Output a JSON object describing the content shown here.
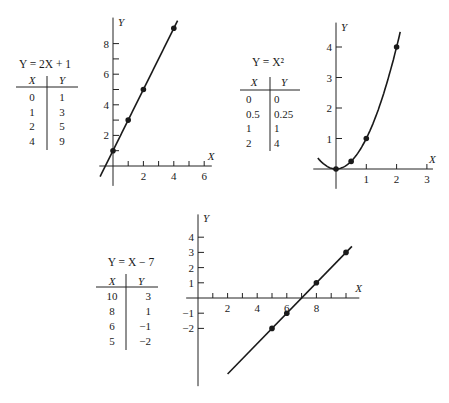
{
  "chart_data": [
    {
      "type": "line",
      "title": "Y = 2X + 1",
      "equation": "Y = 2X + 1",
      "xlabel": "X",
      "ylabel": "Y",
      "table": {
        "headers": [
          "X",
          "Y"
        ],
        "rows": [
          [
            "0",
            "1"
          ],
          [
            "1",
            "3"
          ],
          [
            "2",
            "5"
          ],
          [
            "4",
            "9"
          ]
        ]
      },
      "points": [
        [
          0,
          1
        ],
        [
          1,
          3
        ],
        [
          2,
          5
        ],
        [
          4,
          9
        ]
      ],
      "x_ticks": [
        1,
        2,
        3,
        4,
        5,
        6
      ],
      "x_tick_labels": [
        "2",
        "4",
        "6"
      ],
      "y_ticks": [
        1,
        2,
        3,
        4,
        5,
        6,
        7,
        8
      ],
      "y_tick_labels": [
        "2",
        "4",
        "6",
        "8"
      ],
      "xlim": [
        -0.9,
        6.5
      ],
      "ylim": [
        -1.3,
        9.7
      ],
      "grid": false
    },
    {
      "type": "line",
      "title": "Y = X²",
      "equation": "Y = X²",
      "xlabel": "X",
      "ylabel": "Y",
      "table": {
        "headers": [
          "X",
          "Y"
        ],
        "rows": [
          [
            "0",
            "0"
          ],
          [
            "0.5",
            "0.25"
          ],
          [
            "1",
            "1"
          ],
          [
            "2",
            "4"
          ]
        ]
      },
      "points": [
        [
          0,
          0
        ],
        [
          0.5,
          0.25
        ],
        [
          1,
          1
        ],
        [
          2,
          4
        ]
      ],
      "x_ticks": [
        1,
        2,
        3
      ],
      "x_tick_labels": [
        "1",
        "2",
        "3"
      ],
      "y_ticks": [
        1,
        2,
        3,
        4
      ],
      "y_tick_labels": [
        "1",
        "2",
        "3",
        "4"
      ],
      "xlim": [
        -0.75,
        3.2
      ],
      "ylim": [
        -0.65,
        4.8
      ],
      "grid": false
    },
    {
      "type": "line",
      "title": "Y = X − 7",
      "equation": "Y = X − 7",
      "xlabel": "X",
      "ylabel": "Y",
      "table": {
        "headers": [
          "X",
          "Y"
        ],
        "rows": [
          [
            "10",
            "3"
          ],
          [
            "8",
            "1"
          ],
          [
            "6",
            "−1"
          ],
          [
            "5",
            "−2"
          ]
        ]
      },
      "points": [
        [
          10,
          3
        ],
        [
          8,
          1
        ],
        [
          6,
          -1
        ],
        [
          5,
          -2
        ]
      ],
      "x_ticks": [
        1,
        2,
        3,
        4,
        5,
        6,
        7,
        8,
        9,
        10
      ],
      "x_tick_labels": [
        "2",
        "4",
        "6",
        "8"
      ],
      "y_ticks": [
        -2,
        -1,
        1,
        2,
        3,
        4
      ],
      "y_tick_labels": [
        "−2",
        "−1",
        "1",
        "2",
        "3",
        "4"
      ],
      "xlim": [
        -0.8,
        10.9
      ],
      "ylim": [
        -5.8,
        5.5
      ],
      "grid": false
    }
  ]
}
